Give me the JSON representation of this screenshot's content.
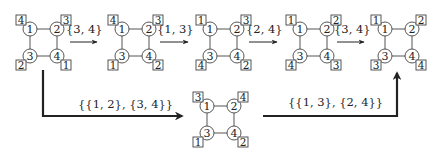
{
  "colors": {
    "ink": "#222222",
    "edge": "#555555",
    "background": "#ffffff"
  },
  "geometry": {
    "node_radius": 7,
    "spacing": 27,
    "box_size": 10
  },
  "states": [
    {
      "id": "s1",
      "origin": [
        30,
        29
      ],
      "nodes": [
        "1",
        "2",
        "3",
        "4"
      ],
      "boxes": [
        "4",
        "3",
        "2",
        "1"
      ]
    },
    {
      "id": "s2",
      "origin": [
        122,
        29
      ],
      "nodes": [
        "1",
        "2",
        "3",
        "4"
      ],
      "boxes": [
        "4",
        "3",
        "1",
        "2"
      ]
    },
    {
      "id": "s3",
      "origin": [
        210,
        29
      ],
      "nodes": [
        "1",
        "2",
        "3",
        "4"
      ],
      "boxes": [
        "1",
        "3",
        "4",
        "2"
      ]
    },
    {
      "id": "s4",
      "origin": [
        300,
        29
      ],
      "nodes": [
        "1",
        "2",
        "3",
        "4"
      ],
      "boxes": [
        "1",
        "2",
        "4",
        "3"
      ]
    },
    {
      "id": "s5",
      "origin": [
        385,
        29
      ],
      "nodes": [
        "1",
        "2",
        "3",
        "4"
      ],
      "boxes": [
        "1",
        "2",
        "3",
        "4"
      ]
    },
    {
      "id": "s6",
      "origin": [
        207,
        106
      ],
      "nodes": [
        "1",
        "2",
        "3",
        "4"
      ],
      "boxes": [
        "3",
        "4",
        "1",
        "2"
      ]
    }
  ],
  "transitions": {
    "t1": {
      "label": "{3, 4}"
    },
    "t2": {
      "label": "{1, 3}"
    },
    "t3": {
      "label": "{2, 4}"
    },
    "t4": {
      "label": "{3, 4}"
    },
    "t5": {
      "label": "{{1, 2}, {3, 4}}"
    },
    "t6": {
      "label": "{{1, 3}, {2, 4}}"
    }
  }
}
